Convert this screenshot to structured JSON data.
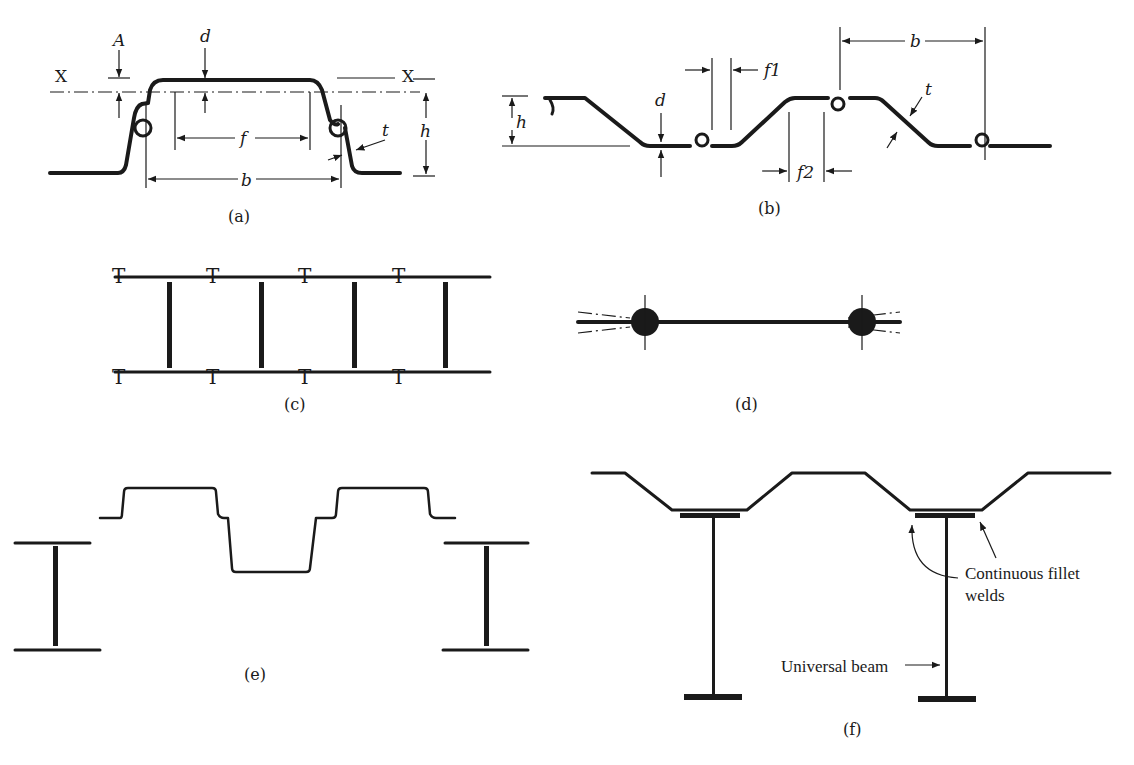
{
  "figure": {
    "panels": [
      {
        "id": "a",
        "caption": "(a)",
        "labels": {
          "A": "A",
          "d": "d",
          "X_left": "X",
          "X_right": "X",
          "f": "f",
          "b": "b",
          "t": "t",
          "h": "h"
        }
      },
      {
        "id": "b",
        "caption": "(b)",
        "labels": {
          "h": "h",
          "d": "d",
          "f1": "f1",
          "f2": "f2",
          "b": "b",
          "t": "t"
        }
      },
      {
        "id": "c",
        "caption": "(c)"
      },
      {
        "id": "d",
        "caption": "(d)"
      },
      {
        "id": "e",
        "caption": "(e)"
      },
      {
        "id": "f",
        "caption": "(f)",
        "annotations": {
          "welds_line1": "Continuous fillet",
          "welds_line2": "welds",
          "beam": "Universal beam"
        }
      }
    ]
  },
  "colors": {
    "ink": "#1a1a1a",
    "background": "#ffffff"
  }
}
